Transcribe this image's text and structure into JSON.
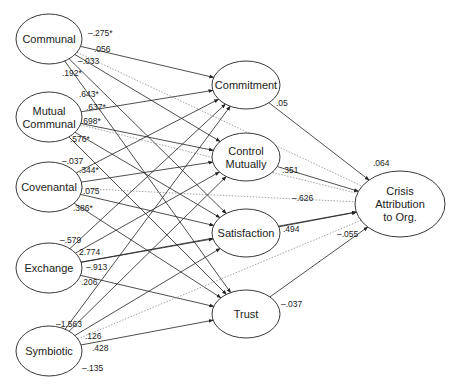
{
  "nodes": {
    "communal": {
      "label": [
        "Communal"
      ],
      "cx": 49,
      "cy": 39,
      "rx": 33,
      "ry": 25
    },
    "mutual_communal": {
      "label": [
        "Mutual",
        "Communal"
      ],
      "cx": 49,
      "cy": 117,
      "rx": 33,
      "ry": 25
    },
    "covenantal": {
      "label": [
        "Covenantal"
      ],
      "cx": 49,
      "cy": 187,
      "rx": 33,
      "ry": 25
    },
    "exchange": {
      "label": [
        "Exchange"
      ],
      "cx": 49,
      "cy": 268,
      "rx": 33,
      "ry": 25
    },
    "symbiotic": {
      "label": [
        "Symbiotic"
      ],
      "cx": 49,
      "cy": 351,
      "rx": 33,
      "ry": 25
    },
    "commitment": {
      "label": [
        "Commitment"
      ],
      "cx": 246,
      "cy": 85,
      "rx": 34,
      "ry": 24
    },
    "control_mutually": {
      "label": [
        "Control",
        "Mutually"
      ],
      "cx": 246,
      "cy": 157,
      "rx": 34,
      "ry": 24
    },
    "satisfaction": {
      "label": [
        "Satisfaction"
      ],
      "cx": 246,
      "cy": 233,
      "rx": 34,
      "ry": 24
    },
    "trust": {
      "label": [
        "Trust"
      ],
      "cx": 246,
      "cy": 314,
      "rx": 34,
      "ry": 24
    },
    "crisis": {
      "label": [
        "Crisis",
        "Attribution",
        "to Org."
      ],
      "cx": 400,
      "cy": 204,
      "rx": 45,
      "ry": 33
    }
  },
  "edges": [
    {
      "from": "communal",
      "to": "commitment",
      "label": "–.275*",
      "style": "solid",
      "lx": 88,
      "ly": 36
    },
    {
      "from": "communal",
      "to": "crisis",
      "label": ".056",
      "style": "dotted",
      "lx": 94,
      "ly": 52
    },
    {
      "from": "communal",
      "to": "satisfaction",
      "label": "–.033",
      "style": "solid",
      "lx": 78,
      "ly": 64
    },
    {
      "from": "communal",
      "to": "trust",
      "label": ".192*",
      "style": "solid",
      "lx": 62,
      "ly": 76
    },
    {
      "from": "communal",
      "to": "control_mutually",
      "label": "",
      "style": "solid",
      "lx": 0,
      "ly": 0
    },
    {
      "from": "mutual_communal",
      "to": "commitment",
      "label": ".643*",
      "style": "solid",
      "lx": 79,
      "ly": 97
    },
    {
      "from": "mutual_communal",
      "to": "control_mutually",
      "label": ".637*",
      "style": "solid",
      "lx": 86,
      "ly": 110
    },
    {
      "from": "mutual_communal",
      "to": "satisfaction",
      "label": ".698*",
      "style": "solid",
      "lx": 81,
      "ly": 124
    },
    {
      "from": "mutual_communal",
      "to": "crisis",
      "label": ".576*",
      "style": "dotted",
      "lx": 70,
      "ly": 142
    },
    {
      "from": "mutual_communal",
      "to": "trust",
      "label": "",
      "style": "solid",
      "lx": 0,
      "ly": 0
    },
    {
      "from": "covenantal",
      "to": "commitment",
      "label": "–.037",
      "style": "solid",
      "lx": 62,
      "ly": 164
    },
    {
      "from": "covenantal",
      "to": "control_mutually",
      "label": ".344*",
      "style": "solid",
      "lx": 79,
      "ly": 173
    },
    {
      "from": "covenantal",
      "to": "crisis",
      "label": ".075",
      "style": "dotted",
      "lx": 83,
      "ly": 194
    },
    {
      "from": "covenantal",
      "to": "satisfaction",
      "label": ".386*",
      "style": "solid",
      "lx": 73,
      "ly": 211
    },
    {
      "from": "covenantal",
      "to": "trust",
      "label": "",
      "style": "solid",
      "lx": 0,
      "ly": 0
    },
    {
      "from": "exchange",
      "to": "commitment",
      "label": "–.579",
      "style": "solid",
      "lx": 60,
      "ly": 243
    },
    {
      "from": "exchange",
      "to": "control_mutually",
      "label": "2.774",
      "style": "solid",
      "lx": 79,
      "ly": 255
    },
    {
      "from": "exchange",
      "to": "satisfaction",
      "label": "–.913",
      "style": "solid",
      "lx": 86,
      "ly": 270
    },
    {
      "from": "exchange",
      "to": "trust",
      "label": ".206",
      "style": "solid",
      "lx": 81,
      "ly": 285
    },
    {
      "from": "exchange",
      "to": "crisis",
      "label": "",
      "style": "solid",
      "lx": 0,
      "ly": 0
    },
    {
      "from": "symbiotic",
      "to": "commitment",
      "label": "–1.563",
      "style": "solid",
      "lx": 56,
      "ly": 327
    },
    {
      "from": "symbiotic",
      "to": "control_mutually",
      "label": ".126",
      "style": "solid",
      "lx": 85,
      "ly": 339
    },
    {
      "from": "symbiotic",
      "to": "crisis",
      "label": ".428",
      "style": "dotted",
      "lx": 92,
      "ly": 351
    },
    {
      "from": "symbiotic",
      "to": "trust",
      "label": "–.135",
      "style": "solid",
      "lx": 82,
      "ly": 371
    },
    {
      "from": "symbiotic",
      "to": "satisfaction",
      "label": "",
      "style": "solid",
      "lx": 0,
      "ly": 0
    },
    {
      "from": "commitment",
      "to": "crisis",
      "label": ".05",
      "style": "solid",
      "lx": 276,
      "ly": 106
    },
    {
      "from": "control_mutually",
      "to": "crisis",
      "label": ".351",
      "style": "solid",
      "lx": 282,
      "ly": 173
    },
    {
      "from": "satisfaction",
      "to": "crisis",
      "label": ".494",
      "style": "solid",
      "lx": 283,
      "ly": 232
    },
    {
      "from": "trust",
      "to": "crisis",
      "label": "–.037",
      "style": "solid",
      "lx": 281,
      "ly": 307
    }
  ],
  "extra_labels": [
    {
      "text": ".064",
      "x": 373,
      "y": 166
    },
    {
      "text": "–.626",
      "x": 292,
      "y": 201
    },
    {
      "text": "–.055",
      "x": 337,
      "y": 237
    }
  ],
  "colors": {
    "line": "#222222",
    "dotted": "#9a9a9a",
    "node_stroke": "#222222",
    "background": "#ffffff"
  }
}
